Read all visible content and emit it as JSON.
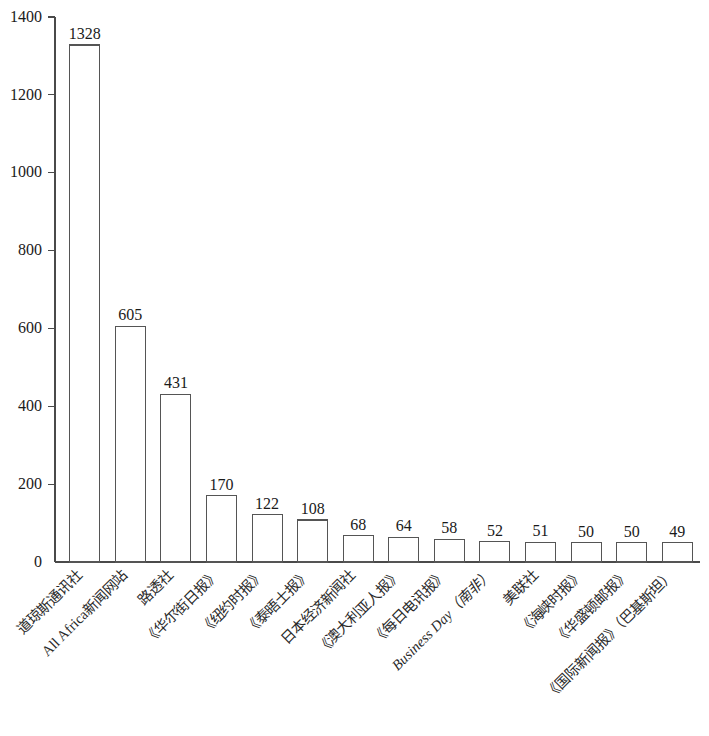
{
  "chart_data": {
    "type": "bar",
    "title": "",
    "subtitle": "",
    "xlabel": "",
    "ylabel": "",
    "ylim": [
      0,
      1400
    ],
    "yticks": [
      0,
      200,
      400,
      600,
      800,
      1000,
      1200,
      1400
    ],
    "ytick_labels": [
      "0",
      "200",
      "400",
      "600",
      "800",
      "1000",
      "1200",
      "1400"
    ],
    "grid": false,
    "legend": null,
    "legend_position": "none",
    "bar_style": "outlined-white",
    "label_rotation_deg": 45,
    "categories": [
      "道琼斯通讯社",
      "All Africa新闻网站",
      "路透社",
      "《华尔街日报》",
      "《纽约时报》",
      "《泰晤士报》",
      "日本经济新闻社",
      "《澳大利亚人报》",
      "《每日电讯报》",
      "Business Day（南非）",
      "美联社",
      "《海峡时报》",
      "《华盛顿邮报》",
      "《国际新闻报》（巴基斯坦）"
    ],
    "values": [
      1328,
      605,
      431,
      170,
      122,
      108,
      68,
      64,
      58,
      52,
      51,
      50,
      50,
      49
    ],
    "value_labels": [
      "1328",
      "605",
      "431",
      "170",
      "122",
      "108",
      "68",
      "64",
      "58",
      "52",
      "51",
      "50",
      "50",
      "49"
    ],
    "italic_categories": [
      "Business Day（南非）"
    ],
    "colors": {
      "bar_fill": "#ffffff",
      "bar_stroke": "#555555",
      "axis": "#4a4a4a",
      "text": "#1a1a1a",
      "background": "#ffffff"
    }
  }
}
